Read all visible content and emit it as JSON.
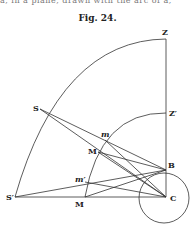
{
  "top_text": "a, in a plane, drawn with the arc of a,",
  "caption": "Fig. 24.",
  "labels": {
    "Z": "Z",
    "Z_prime": "Z′",
    "S": "S",
    "S_prime": "S′",
    "m": "m",
    "M_upper": "M",
    "m_prime": "m′",
    "M_lower": "M",
    "B": "B",
    "C": "C"
  }
}
